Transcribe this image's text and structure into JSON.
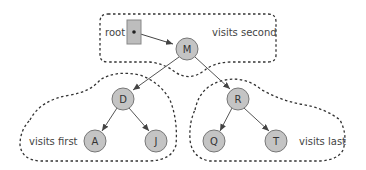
{
  "colors": {
    "node_fill": "#c4c4c4",
    "node_stroke": "#777777",
    "edge": "#555555",
    "dash": "#333333",
    "root_fill": "#bdbdbd"
  },
  "labels": {
    "root": "root",
    "visits_second": "visits second",
    "visits_first": "visits first",
    "visits_last": "visits last"
  },
  "nodes": {
    "M": "M",
    "D": "D",
    "R": "R",
    "A": "A",
    "J": "J",
    "Q": "Q",
    "T": "T"
  }
}
